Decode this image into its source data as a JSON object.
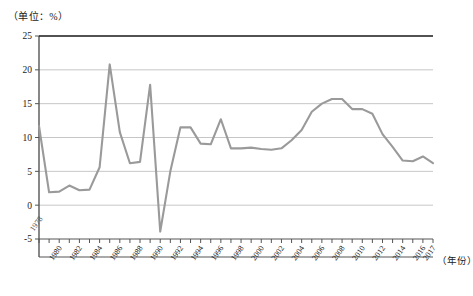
{
  "unit_label": "（单位：%）",
  "xaxis_title": "（年份）",
  "inline_start_label": "1978",
  "colors": {
    "line": "#9a9a9a",
    "axis": "#555555",
    "grid": "#b8b8b8",
    "text": "#1a1a1a"
  },
  "chart_data": {
    "type": "line",
    "title": "",
    "subtitle": "",
    "xlabel": "（年份）",
    "ylabel": "（单位：%）",
    "unit": "%",
    "grid": true,
    "legend": false,
    "legend_position": "none",
    "xlim": [
      1978,
      2017
    ],
    "ylim": [
      -5,
      25
    ],
    "yticks": [
      25,
      20,
      15,
      10,
      5,
      0,
      -5
    ],
    "ytick_labels": [
      "25",
      "20",
      "15",
      "10",
      "5",
      "0",
      "-5"
    ],
    "xticks": [
      1980,
      1982,
      1984,
      1986,
      1988,
      1990,
      1992,
      1994,
      1996,
      1998,
      2000,
      2002,
      2004,
      2006,
      2008,
      2010,
      2012,
      2014,
      2016,
      2017
    ],
    "xtick_labels": [
      "1980",
      "1982",
      "1984",
      "1986",
      "1988",
      "1990",
      "1992",
      "1994",
      "1996",
      "1998",
      "2000",
      "2002",
      "2004",
      "2006",
      "2008",
      "2010",
      "2012",
      "2014",
      "2016",
      "2017"
    ],
    "annotations": [
      {
        "text": "1978",
        "x": 1978,
        "y": -2.0,
        "rotation": -55
      }
    ],
    "x": [
      1978,
      1979,
      1980,
      1981,
      1982,
      1983,
      1984,
      1985,
      1986,
      1987,
      1988,
      1989,
      1990,
      1991,
      1992,
      1993,
      1994,
      1995,
      1996,
      1997,
      1998,
      1999,
      2000,
      2001,
      2002,
      2003,
      2004,
      2005,
      2006,
      2007,
      2008,
      2009,
      2010,
      2011,
      2012,
      2013,
      2014,
      2015,
      2016,
      2017
    ],
    "values": [
      11.7,
      1.9,
      2.0,
      2.9,
      2.2,
      2.3,
      5.6,
      20.8,
      10.8,
      6.2,
      6.4,
      17.8,
      -3.9,
      5.0,
      11.5,
      11.5,
      9.1,
      9.0,
      12.7,
      8.4,
      8.4,
      8.5,
      8.3,
      8.2,
      8.4,
      9.6,
      11.1,
      13.8,
      15.0,
      15.7,
      15.7,
      14.2,
      14.2,
      13.5,
      10.5,
      8.6,
      6.6,
      6.5,
      7.2,
      6.2
    ],
    "series": [
      {
        "name": "",
        "values": [
          11.7,
          1.9,
          2.0,
          2.9,
          2.2,
          2.3,
          5.6,
          20.8,
          10.8,
          6.2,
          6.4,
          17.8,
          -3.9,
          5.0,
          11.5,
          11.5,
          9.1,
          9.0,
          12.7,
          8.4,
          8.4,
          8.5,
          8.3,
          8.2,
          8.4,
          9.6,
          11.1,
          13.8,
          15.0,
          15.7,
          15.7,
          14.2,
          14.2,
          13.5,
          10.5,
          8.6,
          6.6,
          6.5,
          7.2,
          6.2
        ]
      }
    ]
  }
}
